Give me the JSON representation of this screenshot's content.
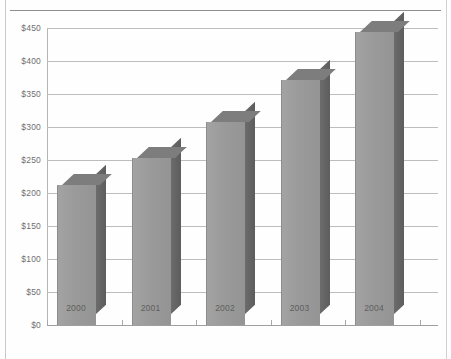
{
  "page": {
    "title_fragment": "",
    "has_top_rule": true,
    "has_page_borders": true
  },
  "chart_data": {
    "type": "bar",
    "title": "",
    "subtitle": "",
    "xlabel": "",
    "ylabel": "",
    "categories": [
      "2000",
      "2001",
      "2002",
      "2003",
      "2004"
    ],
    "values": [
      212,
      253,
      307,
      371,
      444
    ],
    "ylim": [
      0,
      450
    ],
    "ytick_values": [
      0,
      50,
      100,
      150,
      200,
      250,
      300,
      350,
      400,
      450
    ],
    "ytick_labels": [
      "$0",
      "$50",
      "$100",
      "$150",
      "$200",
      "$250",
      "$300",
      "$350",
      "$400",
      "$450"
    ],
    "grid": true,
    "grid_axis": "y",
    "legend": false,
    "legend_position": "none",
    "style": "3d-column",
    "series": [
      {
        "name": "Series 1",
        "values": [
          212,
          253,
          307,
          371,
          444
        ]
      }
    ],
    "colors": {
      "bar_front": "#9a9a9a",
      "bar_side": "#656565",
      "bar_top": "#7d7d7d",
      "gridline": "#bdbdbd",
      "axis": "#9e9e9e",
      "tick_label": "#6f6f6f",
      "category_label": "#5e5e5e",
      "page_border": "#c9c9c9",
      "top_rule": "#8e8e8e",
      "background": "#ffffff"
    }
  }
}
